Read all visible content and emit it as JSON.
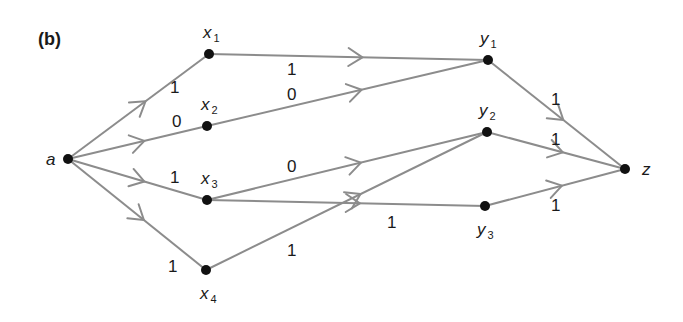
{
  "figure": {
    "label": "(b)"
  },
  "nodes": [
    {
      "id": "a",
      "base": "a",
      "sub": "",
      "x": 68,
      "y": 159,
      "lx": 46,
      "ly": 165
    },
    {
      "id": "x1",
      "base": "x",
      "sub": "1",
      "x": 209,
      "y": 54,
      "lx": 203,
      "ly": 38
    },
    {
      "id": "x2",
      "base": "x",
      "sub": "2",
      "x": 207,
      "y": 126,
      "lx": 201,
      "ly": 110
    },
    {
      "id": "x3",
      "base": "x",
      "sub": "3",
      "x": 207,
      "y": 200,
      "lx": 201,
      "ly": 184
    },
    {
      "id": "x4",
      "base": "x",
      "sub": "4",
      "x": 206,
      "y": 270,
      "lx": 200,
      "ly": 299
    },
    {
      "id": "y1",
      "base": "y",
      "sub": "1",
      "x": 488,
      "y": 60,
      "lx": 480,
      "ly": 44
    },
    {
      "id": "y2",
      "base": "y",
      "sub": "2",
      "x": 487,
      "y": 132,
      "lx": 479,
      "ly": 116
    },
    {
      "id": "y3",
      "base": "y",
      "sub": "3",
      "x": 485,
      "y": 206,
      "lx": 477,
      "ly": 235
    },
    {
      "id": "z",
      "base": "z",
      "sub": "",
      "x": 625,
      "y": 169,
      "lx": 642,
      "ly": 175
    }
  ],
  "edges": [
    {
      "from": "a",
      "to": "x1",
      "weight": "1",
      "wx": 170,
      "wy": 93
    },
    {
      "from": "a",
      "to": "x2",
      "weight": "0",
      "wx": 172,
      "wy": 127
    },
    {
      "from": "a",
      "to": "x3",
      "weight": "1",
      "wx": 170,
      "wy": 183
    },
    {
      "from": "a",
      "to": "x4",
      "weight": "1",
      "wx": 168,
      "wy": 272
    },
    {
      "from": "x1",
      "to": "y1",
      "weight": "1",
      "wx": 287,
      "wy": 75
    },
    {
      "from": "x2",
      "to": "y1",
      "weight": "0",
      "wx": 287,
      "wy": 100
    },
    {
      "from": "x3",
      "to": "y2",
      "weight": "0",
      "wx": 287,
      "wy": 172
    },
    {
      "from": "x3",
      "to": "y3",
      "weight": "1",
      "wx": 387,
      "wy": 228
    },
    {
      "from": "x4",
      "to": "y2",
      "weight": "1",
      "wx": 287,
      "wy": 256
    },
    {
      "from": "y1",
      "to": "z",
      "weight": "1",
      "wx": 551,
      "wy": 105
    },
    {
      "from": "y2",
      "to": "z",
      "weight": "1",
      "wx": 551,
      "wy": 145
    },
    {
      "from": "y3",
      "to": "z",
      "weight": "1",
      "wx": 551,
      "wy": 211
    }
  ],
  "colors": {
    "edge": "#8c8c8c",
    "node": "#111111",
    "text": "#1a1a1a"
  }
}
